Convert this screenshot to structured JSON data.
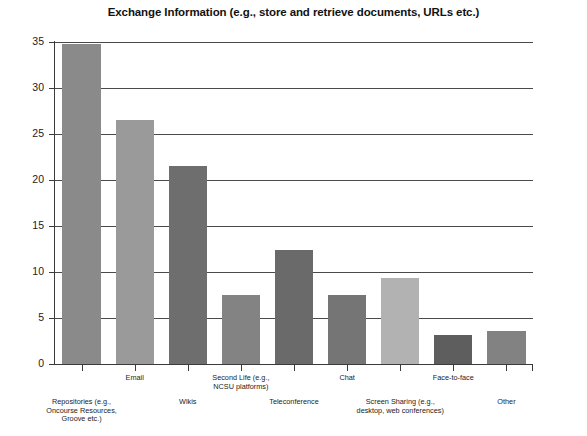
{
  "chart_data": {
    "type": "bar",
    "title": "Exchange Information (e.g., store and retrieve documents, URLs etc.)",
    "xlabel": "",
    "ylabel": "",
    "ylim": [
      0,
      35
    ],
    "yticks": [
      0,
      5,
      10,
      15,
      20,
      25,
      30,
      35
    ],
    "grid": true,
    "legend": "none",
    "categories": [
      "Repositories (e.g., Oncourse Resources, Groove etc.)",
      "Email",
      "Wikis",
      "Second Life (e.g. NCSU platforms)",
      "Teleconference",
      "Chat",
      "Screen Sharing (e.g. desktop, web conferences)",
      "Face-to-face",
      "Other"
    ],
    "values": [
      34.8,
      26.5,
      21.5,
      7.5,
      12.4,
      7.5,
      9.4,
      3.1,
      3.6
    ],
    "bar_colors": [
      "#8a8a8a",
      "#9a9a9a",
      "#6e6e6e",
      "#838383",
      "#6a6a6a",
      "#757575",
      "#b2b2b2",
      "#5e5e5e",
      "#828282"
    ]
  },
  "axis": {
    "tick_labels": [
      "0",
      "5",
      "10",
      "15",
      "20",
      "25",
      "30",
      "35"
    ]
  },
  "category_labels": [
    {
      "lines": [
        "Repositories (e.g.,",
        "Oncourse Resources,",
        "Groove etc.)"
      ],
      "row": 1
    },
    {
      "lines": [
        "Email"
      ],
      "row": 0
    },
    {
      "lines": [
        "Wikis"
      ],
      "row": 1
    },
    {
      "lines": [
        "Second Life (e.g.,",
        "NCSU platforms)"
      ],
      "row": 0
    },
    {
      "lines": [
        "Teleconference"
      ],
      "row": 1
    },
    {
      "lines": [
        "Chat"
      ],
      "row": 0
    },
    {
      "lines": [
        "Screen Sharing (e.g.,",
        "desktop, web conferences)"
      ],
      "row": 1
    },
    {
      "lines": [
        "Face-to-face"
      ],
      "row": 0
    },
    {
      "lines": [
        "Other"
      ],
      "row": 1
    }
  ]
}
